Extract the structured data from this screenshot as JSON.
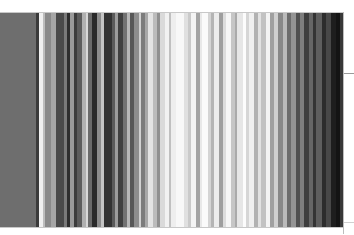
{
  "figure": {
    "stripes": [
      {
        "w": 28,
        "c": "#6e6e6e"
      },
      {
        "w": 2,
        "c": "#3a3a3a"
      },
      {
        "w": 3,
        "c": "#f0f0f0"
      },
      {
        "w": 2,
        "c": "#bdbdbd"
      },
      {
        "w": 4,
        "c": "#8a8a8a"
      },
      {
        "w": 4,
        "c": "#a6a6a6"
      },
      {
        "w": 6,
        "c": "#4a4a4a"
      },
      {
        "w": 3,
        "c": "#7a7a7a"
      },
      {
        "w": 2,
        "c": "#2e2e2e"
      },
      {
        "w": 3,
        "c": "#9a9a9a"
      },
      {
        "w": 2,
        "c": "#3c3c3c"
      },
      {
        "w": 4,
        "c": "#5c5c5c"
      },
      {
        "w": 3,
        "c": "#b0b0b0"
      },
      {
        "w": 2,
        "c": "#d8d8d8"
      },
      {
        "w": 3,
        "c": "#6a6a6a"
      },
      {
        "w": 4,
        "c": "#2a2a2a"
      },
      {
        "w": 3,
        "c": "#8c8c8c"
      },
      {
        "w": 2,
        "c": "#c4c4c4"
      },
      {
        "w": 6,
        "c": "#323232"
      },
      {
        "w": 3,
        "c": "#5a5a5a"
      },
      {
        "w": 2,
        "c": "#9c9c9c"
      },
      {
        "w": 4,
        "c": "#404040"
      },
      {
        "w": 3,
        "c": "#727272"
      },
      {
        "w": 2,
        "c": "#b8b8b8"
      },
      {
        "w": 3,
        "c": "#585858"
      },
      {
        "w": 4,
        "c": "#8e8e8e"
      },
      {
        "w": 2,
        "c": "#d2d2d2"
      },
      {
        "w": 3,
        "c": "#7c7c7c"
      },
      {
        "w": 2,
        "c": "#a8a8a8"
      },
      {
        "w": 4,
        "c": "#e4e4e4"
      },
      {
        "w": 3,
        "c": "#bcbcbc"
      },
      {
        "w": 2,
        "c": "#909090"
      },
      {
        "w": 4,
        "c": "#dadada"
      },
      {
        "w": 3,
        "c": "#f2f2f2"
      },
      {
        "w": 2,
        "c": "#c0c0c0"
      },
      {
        "w": 4,
        "c": "#eeeeee"
      },
      {
        "w": 6,
        "c": "#f8f8f8"
      },
      {
        "w": 3,
        "c": "#e0e0e0"
      },
      {
        "w": 2,
        "c": "#cacaca"
      },
      {
        "w": 4,
        "c": "#f4f4f4"
      },
      {
        "w": 3,
        "c": "#a4a4a4"
      },
      {
        "w": 2,
        "c": "#e8e8e8"
      },
      {
        "w": 4,
        "c": "#fafafa"
      },
      {
        "w": 3,
        "c": "#d4d4d4"
      },
      {
        "w": 2,
        "c": "#b4b4b4"
      },
      {
        "w": 4,
        "c": "#ececec"
      },
      {
        "w": 3,
        "c": "#9e9e9e"
      },
      {
        "w": 2,
        "c": "#dcdcdc"
      },
      {
        "w": 4,
        "c": "#f6f6f6"
      },
      {
        "w": 3,
        "c": "#c6c6c6"
      },
      {
        "w": 2,
        "c": "#aaaaaa"
      },
      {
        "w": 4,
        "c": "#e6e6e6"
      },
      {
        "w": 3,
        "c": "#fcfcfc"
      },
      {
        "w": 2,
        "c": "#d6d6d6"
      },
      {
        "w": 4,
        "c": "#f0f0f0"
      },
      {
        "w": 3,
        "c": "#b2b2b2"
      },
      {
        "w": 2,
        "c": "#e2e2e2"
      },
      {
        "w": 4,
        "c": "#c2c2c2"
      },
      {
        "w": 3,
        "c": "#f4f4f4"
      },
      {
        "w": 3,
        "c": "#a0a0a0"
      },
      {
        "w": 3,
        "c": "#d0d0d0"
      },
      {
        "w": 4,
        "c": "#888888"
      },
      {
        "w": 3,
        "c": "#bababa"
      },
      {
        "w": 3,
        "c": "#6c6c6c"
      },
      {
        "w": 4,
        "c": "#949494"
      },
      {
        "w": 3,
        "c": "#505050"
      },
      {
        "w": 3,
        "c": "#7e7e7e"
      },
      {
        "w": 4,
        "c": "#3e3e3e"
      },
      {
        "w": 3,
        "c": "#666666"
      },
      {
        "w": 3,
        "c": "#343434"
      },
      {
        "w": 4,
        "c": "#5e5e5e"
      },
      {
        "w": 3,
        "c": "#2c2c2c"
      },
      {
        "w": 4,
        "c": "#484848"
      },
      {
        "w": 4,
        "c": "#1e1e1e"
      },
      {
        "w": 3,
        "c": "#141414"
      },
      {
        "w": 3,
        "c": "#383838"
      }
    ],
    "frame": {
      "top": 12,
      "height": 216,
      "width": 344,
      "border": "#c8c8c8"
    },
    "ticks": [
      {
        "position": "right",
        "y": 73
      },
      {
        "position": "right",
        "y": 222
      }
    ]
  }
}
